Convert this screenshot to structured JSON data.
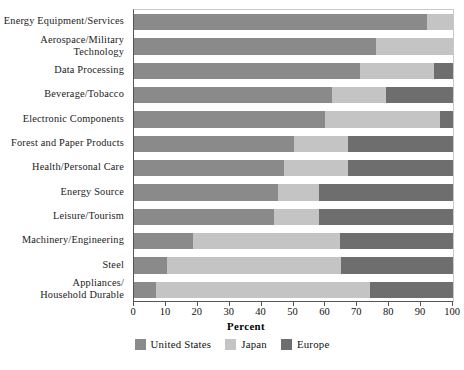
{
  "chart_data": {
    "type": "bar",
    "orientation": "horizontal",
    "stacked": true,
    "title": "",
    "xlabel": "Percent",
    "ylabel": "",
    "xlim": [
      0,
      100
    ],
    "xticks": [
      0,
      10,
      20,
      30,
      40,
      50,
      60,
      70,
      80,
      90,
      100
    ],
    "xtick_labels": [
      "0",
      "10",
      "20",
      "30",
      "40",
      "50",
      "60",
      "70",
      "80",
      "90",
      "100"
    ],
    "grid": false,
    "legend_position": "bottom",
    "categories": [
      "Energy Equipment/Services",
      "Aerospace/Military Technology",
      "Data Processing",
      "Beverage/Tobacco",
      "Electronic Components",
      "Forest and Paper Products",
      "Health/Personal Care",
      "Energy Source",
      "Leisure/Tourism",
      "Machinery/Engineering",
      "Steel",
      "Appliances/ Household Durable"
    ],
    "category_lines": [
      [
        "Energy Equipment/Services"
      ],
      [
        "Aerospace/Military",
        "Technology"
      ],
      [
        "Data Processing"
      ],
      [
        "Beverage/Tobacco"
      ],
      [
        "Electronic Components"
      ],
      [
        "Forest and Paper Products"
      ],
      [
        "Health/Personal Care"
      ],
      [
        "Energy Source"
      ],
      [
        "Leisure/Tourism"
      ],
      [
        "Machinery/Engineering"
      ],
      [
        "Steel"
      ],
      [
        "Appliances/",
        "Household Durable"
      ]
    ],
    "series": [
      {
        "name": "United States",
        "color": "#8a8a8a",
        "values": [
          92,
          76,
          71,
          62,
          60,
          50,
          47,
          45,
          44,
          18.5,
          10.5,
          7
        ]
      },
      {
        "name": "Japan",
        "color": "#c4c4c4",
        "values": [
          8,
          24,
          23,
          17,
          36,
          17,
          20,
          13,
          14,
          46,
          54.5,
          67
        ]
      },
      {
        "name": "Europe",
        "color": "#6e6e6e",
        "values": [
          0,
          0,
          6,
          21,
          4,
          33,
          33,
          42,
          42,
          35.5,
          35,
          26
        ]
      }
    ]
  },
  "legend": {
    "items": [
      {
        "label": "United States",
        "color": "#8a8a8a"
      },
      {
        "label": "Japan",
        "color": "#c4c4c4"
      },
      {
        "label": "Europe",
        "color": "#6e6e6e"
      }
    ]
  },
  "axis": {
    "x_title": "Percent"
  }
}
